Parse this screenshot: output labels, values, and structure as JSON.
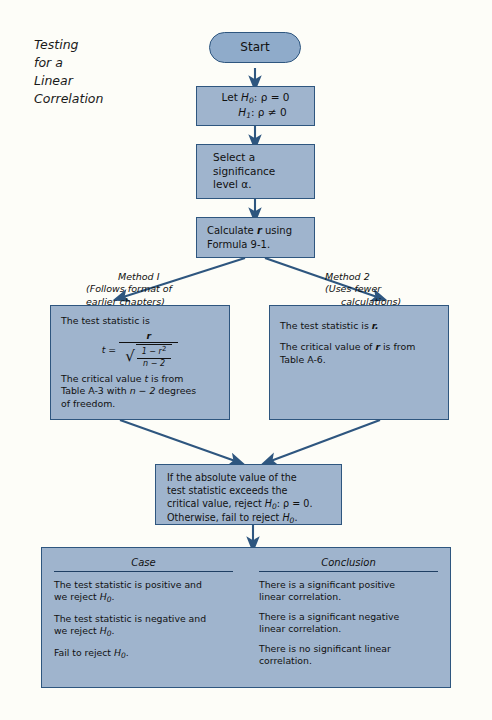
{
  "page": {
    "title_lines": [
      "Testing",
      "for a",
      "Linear",
      "Correlation"
    ],
    "background": "#fdfdf8",
    "node_fill": "#9fb4cd",
    "node_border": "#2e567f",
    "arrow_color": "#2e567f"
  },
  "nodes": {
    "start": {
      "label": "Start",
      "shape": "terminator"
    },
    "hypotheses": {
      "line1_prefix": "Let",
      "line1_h": "H",
      "line1_sub": "0",
      "line1_rest": ": ρ = 0",
      "line2_h": "H",
      "line2_sub": "1",
      "line2_rest": ": ρ ≠ 0"
    },
    "significance": {
      "line1": "Select a",
      "line2": "significance",
      "line3": "level α."
    },
    "calculate": {
      "line1_pre": "Calculate",
      "line1_var": "r",
      "line1_post": "using",
      "line2": "Formula 9-1."
    },
    "method1_box": {
      "line1": "The test statistic is",
      "formula_lhs": "t",
      "formula_eq": "=",
      "formula_num": "r",
      "formula_den_num": "1 − r",
      "formula_den_num_sup": "2",
      "formula_den_den": "n − 2",
      "line2a": "The critical value",
      "line2a_var": "t",
      "line2a_rest": "is from",
      "line2b_pre": "Table A-3 with",
      "line2b_var": "n − 2",
      "line2b_post": "degrees",
      "line2c": "of freedom."
    },
    "method2_box": {
      "line1_pre": "The test statistic is",
      "line1_var": "r.",
      "line2_pre": "The critical value of",
      "line2_var": "r",
      "line2_post": "is from",
      "line3": "Table A-6."
    },
    "decision": {
      "line1": "If the absolute value of the",
      "line2": "test statistic exceeds the",
      "line3_pre": "critical value, reject",
      "line3_h": "H",
      "line3_sub": "0",
      "line3_rest": ": ρ = 0.",
      "line4_pre": "Otherwise, fail to reject",
      "line4_h": "H",
      "line4_sub": "0",
      "line4_rest": "."
    }
  },
  "branch_labels": {
    "method1": {
      "head": "Method I",
      "line2": "(Follows format of",
      "line3": "earlier chapters)"
    },
    "method2": {
      "head": "Method 2",
      "line2": "(Uses fewer",
      "line3": "calculations)"
    }
  },
  "results_table": {
    "headers": [
      "Case",
      "Conclusion"
    ],
    "rows": [
      {
        "case_line1": "The test statistic is positive and",
        "case_line2_pre": "we reject",
        "case_line2_h": "H",
        "case_line2_sub": "0",
        "case_line2_post": ".",
        "conclusion_line1": "There is a significant positive",
        "conclusion_line2": "linear correlation."
      },
      {
        "case_line1": "The test statistic is negative and",
        "case_line2_pre": "we reject",
        "case_line2_h": "H",
        "case_line2_sub": "0",
        "case_line2_post": ".",
        "conclusion_line1": "There is a significant negative",
        "conclusion_line2": "linear correlation."
      },
      {
        "case_line1": "Fail to reject",
        "case_line1_h": "H",
        "case_line1_sub": "0",
        "case_line1_post": ".",
        "case_line2": "",
        "conclusion_line1": "There is no significant linear",
        "conclusion_line2": "correlation."
      }
    ]
  }
}
